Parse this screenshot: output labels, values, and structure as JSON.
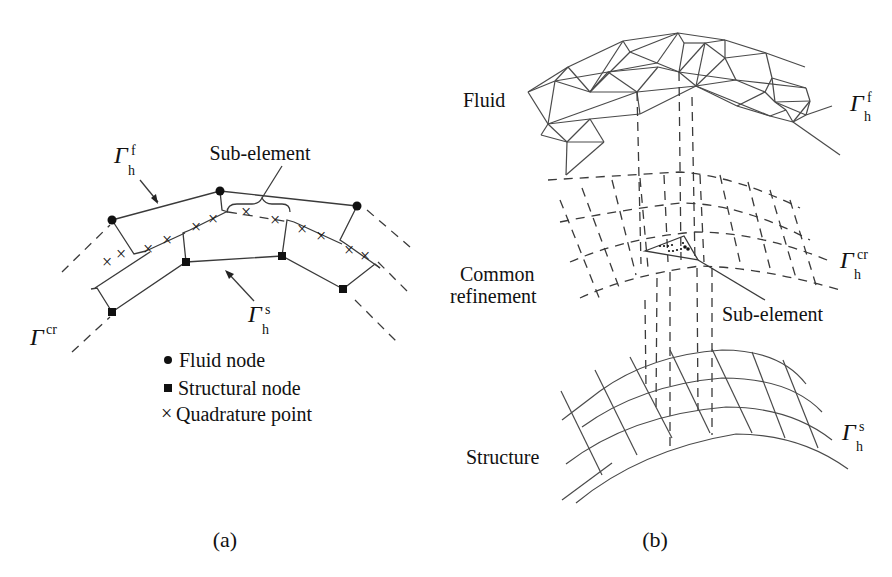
{
  "panel_a": {
    "caption": "(a)",
    "labels": {
      "sub_element": "Sub-element",
      "gamma": "Γ",
      "fluid_interface_sub": "h",
      "fluid_interface_sup": "f",
      "structure_interface_sub": "h",
      "structure_interface_sup": "s",
      "common_refinement_sup": "cr"
    },
    "legend": [
      {
        "symbol": "circle",
        "glyph": "●",
        "label": "Fluid node"
      },
      {
        "symbol": "square",
        "glyph": "■",
        "label": "Structural node"
      },
      {
        "symbol": "cross",
        "glyph": "×",
        "label": "Quadrature point"
      }
    ]
  },
  "panel_b": {
    "caption": "(b)",
    "labels": {
      "fluid": "Fluid",
      "common_refinement_line1": "Common",
      "common_refinement_line2": "refinement",
      "sub_element": "Sub-element",
      "structure": "Structure",
      "gamma": "Γ",
      "fluid_sub": "h",
      "fluid_sup": "f",
      "cr_sub": "h",
      "cr_sup": "cr",
      "structure_sub": "h",
      "structure_sup": "s"
    }
  }
}
